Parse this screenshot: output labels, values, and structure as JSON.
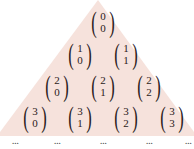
{
  "colors": {
    "triangle_fill": "#f6e2dc",
    "text": "#2a2020"
  },
  "rows": [
    {
      "n": "0",
      "entries": [
        {
          "n": "0",
          "k": "0",
          "x": 103,
          "y": 7
        }
      ]
    },
    {
      "n": "1",
      "entries": [
        {
          "n": "1",
          "k": "0",
          "x": 80,
          "y": 39
        },
        {
          "n": "1",
          "k": "1",
          "x": 126,
          "y": 39
        }
      ]
    },
    {
      "n": "2",
      "entries": [
        {
          "n": "2",
          "k": "0",
          "x": 57,
          "y": 71
        },
        {
          "n": "2",
          "k": "1",
          "x": 103,
          "y": 71
        },
        {
          "n": "2",
          "k": "2",
          "x": 149,
          "y": 71
        }
      ]
    },
    {
      "n": "3",
      "entries": [
        {
          "n": "3",
          "k": "0",
          "x": 35,
          "y": 102
        },
        {
          "n": "3",
          "k": "1",
          "x": 80,
          "y": 102
        },
        {
          "n": "3",
          "k": "2",
          "x": 126,
          "y": 102
        },
        {
          "n": "3",
          "k": "3",
          "x": 172,
          "y": 102
        }
      ]
    }
  ],
  "continuation": {
    "symbol": "...",
    "positions": [
      15,
      57,
      103,
      149,
      188
    ]
  }
}
